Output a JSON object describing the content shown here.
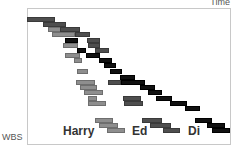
{
  "axes": {
    "x_label": "Time",
    "y_label": "WBS"
  },
  "resources": [
    {
      "name": "Harry",
      "shade": "light",
      "color": "#8e8e8e"
    },
    {
      "name": "Ed",
      "shade": "dark",
      "color": "#4e4e4e"
    },
    {
      "name": "Di",
      "shade": "black",
      "color": "#111111"
    }
  ],
  "bars": [
    {
      "x": 27,
      "y": 17,
      "w": 28,
      "c": "dark"
    },
    {
      "x": 43,
      "y": 22,
      "w": 23,
      "c": "dark"
    },
    {
      "x": 48,
      "y": 27,
      "w": 15,
      "c": "light"
    },
    {
      "x": 60,
      "y": 27,
      "w": 20,
      "c": "dark"
    },
    {
      "x": 52,
      "y": 32,
      "w": 23,
      "c": "light"
    },
    {
      "x": 75,
      "y": 32,
      "w": 15,
      "c": "dark"
    },
    {
      "x": 65,
      "y": 38,
      "w": 13,
      "c": "black"
    },
    {
      "x": 87,
      "y": 38,
      "w": 13,
      "c": "dark"
    },
    {
      "x": 63,
      "y": 43,
      "w": 15,
      "c": "light"
    },
    {
      "x": 88,
      "y": 43,
      "w": 12,
      "c": "dark"
    },
    {
      "x": 77,
      "y": 48,
      "w": 9,
      "c": "black"
    },
    {
      "x": 95,
      "y": 48,
      "w": 14,
      "c": "dark"
    },
    {
      "x": 65,
      "y": 53,
      "w": 15,
      "c": "light"
    },
    {
      "x": 86,
      "y": 53,
      "w": 14,
      "c": "black"
    },
    {
      "x": 74,
      "y": 58,
      "w": 8,
      "c": "light"
    },
    {
      "x": 99,
      "y": 58,
      "w": 13,
      "c": "black"
    },
    {
      "x": 104,
      "y": 63,
      "w": 12,
      "c": "black"
    },
    {
      "x": 77,
      "y": 69,
      "w": 11,
      "c": "light"
    },
    {
      "x": 110,
      "y": 69,
      "w": 12,
      "c": "black"
    },
    {
      "x": 120,
      "y": 75,
      "w": 15,
      "c": "black"
    },
    {
      "x": 76,
      "y": 80,
      "w": 19,
      "c": "light"
    },
    {
      "x": 108,
      "y": 80,
      "w": 13,
      "c": "dark"
    },
    {
      "x": 121,
      "y": 80,
      "w": 24,
      "c": "black"
    },
    {
      "x": 80,
      "y": 85,
      "w": 17,
      "c": "light"
    },
    {
      "x": 140,
      "y": 85,
      "w": 15,
      "c": "black"
    },
    {
      "x": 84,
      "y": 90,
      "w": 19,
      "c": "light"
    },
    {
      "x": 148,
      "y": 90,
      "w": 14,
      "c": "black"
    },
    {
      "x": 88,
      "y": 96,
      "w": 9,
      "c": "light"
    },
    {
      "x": 123,
      "y": 96,
      "w": 18,
      "c": "dark"
    },
    {
      "x": 156,
      "y": 96,
      "w": 16,
      "c": "black"
    },
    {
      "x": 88,
      "y": 101,
      "w": 18,
      "c": "light"
    },
    {
      "x": 124,
      "y": 101,
      "w": 19,
      "c": "dark"
    },
    {
      "x": 170,
      "y": 101,
      "w": 17,
      "c": "black"
    },
    {
      "x": 185,
      "y": 106,
      "w": 15,
      "c": "black"
    },
    {
      "x": 95,
      "y": 118,
      "w": 18,
      "c": "light"
    },
    {
      "x": 142,
      "y": 118,
      "w": 20,
      "c": "dark"
    },
    {
      "x": 195,
      "y": 118,
      "w": 17,
      "c": "black"
    },
    {
      "x": 99,
      "y": 123,
      "w": 19,
      "c": "light"
    },
    {
      "x": 150,
      "y": 123,
      "w": 21,
      "c": "dark"
    },
    {
      "x": 207,
      "y": 123,
      "w": 18,
      "c": "black"
    },
    {
      "x": 107,
      "y": 128,
      "w": 18,
      "c": "light"
    },
    {
      "x": 163,
      "y": 128,
      "w": 17,
      "c": "dark"
    },
    {
      "x": 212,
      "y": 128,
      "w": 18,
      "c": "black"
    }
  ]
}
